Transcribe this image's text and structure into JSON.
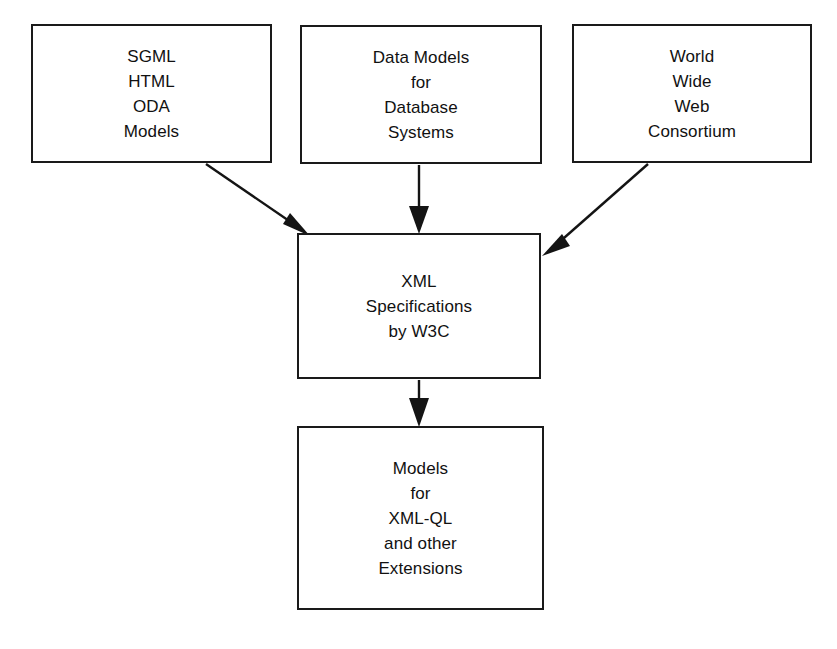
{
  "diagram": {
    "type": "flowchart",
    "background_color": "#ffffff",
    "stroke_color": "#141414",
    "text_color": "#111111",
    "nodes": [
      {
        "id": "sgml",
        "label": "SGML\nHTML\nODA\nModels",
        "lines": [
          "SGML",
          "HTML",
          "ODA",
          "Models"
        ]
      },
      {
        "id": "data-models",
        "label": "Data Models\nfor\nDatabase\nSystems",
        "lines": [
          "Data Models",
          "for",
          "Database",
          "Systems"
        ]
      },
      {
        "id": "w3c",
        "label": "World\nWide\nWeb\nConsortium",
        "lines": [
          "World",
          "Wide",
          "Web",
          "Consortium"
        ]
      },
      {
        "id": "xml-spec",
        "label": "XML\nSpecifications\nby W3C",
        "lines": [
          "XML",
          "Specifications",
          "by W3C"
        ]
      },
      {
        "id": "extensions",
        "label": "Models\nfor\nXML-QL\nand other\nExtensions",
        "lines": [
          "Models",
          "for",
          "XML-QL",
          "and other",
          "Extensions"
        ]
      }
    ],
    "edges": [
      {
        "id": "sgml-to-xmlspec",
        "from": "sgml",
        "to": "xml-spec",
        "style": "diagonal-arrow"
      },
      {
        "id": "datamodels-to-xmlspec",
        "from": "data-models",
        "to": "xml-spec",
        "style": "vertical-arrow"
      },
      {
        "id": "w3c-to-xmlspec",
        "from": "w3c",
        "to": "xml-spec",
        "style": "diagonal-arrow"
      },
      {
        "id": "xmlspec-to-extensions",
        "from": "xml-spec",
        "to": "extensions",
        "style": "vertical-arrow"
      }
    ]
  }
}
